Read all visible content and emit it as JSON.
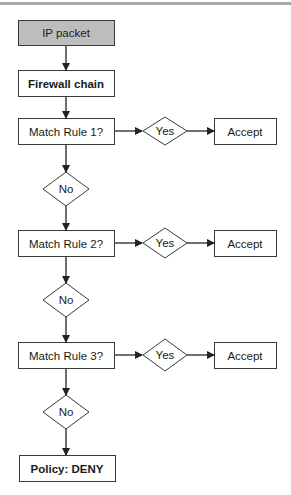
{
  "diagram": {
    "type": "flowchart",
    "start": {
      "label": "IP packet",
      "fill": "#bdbdbd"
    },
    "chain": {
      "label": "Firewall chain"
    },
    "rules": [
      {
        "label": "Match Rule 1?",
        "yes": "Yes",
        "no": "No",
        "action": "Accept"
      },
      {
        "label": "Match Rule 2?",
        "yes": "Yes",
        "no": "No",
        "action": "Accept"
      },
      {
        "label": "Match Rule 3?",
        "yes": "Yes",
        "no": "No",
        "action": "Accept"
      }
    ],
    "end": {
      "label": "Policy: DENY"
    },
    "colors": {
      "stroke": "#3a3a3a",
      "box_fill": "#ffffff",
      "start_fill": "#bdbdbd",
      "top_rule": "#a9a9a9"
    }
  }
}
